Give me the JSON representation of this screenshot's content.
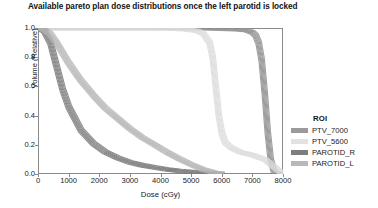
{
  "chart_data": {
    "type": "line",
    "title": "Available pareto plan dose distributions once the left parotid is locked",
    "xlabel": "Dose (cGy)",
    "ylabel": "Volume (Relative)",
    "xlim": [
      0,
      8000
    ],
    "ylim": [
      0.0,
      1.0
    ],
    "xticks": [
      0,
      1000,
      2000,
      3000,
      4000,
      5000,
      6000,
      7000,
      8000
    ],
    "xticklabels": [
      "0",
      "1000",
      "2000",
      "3000",
      "4000",
      "5000",
      "6000",
      "7000",
      "8000"
    ],
    "yticks": [
      0.0,
      0.2,
      0.4,
      0.6,
      0.8,
      1.0
    ],
    "yticklabels": [
      "0.0",
      "0.2",
      "0.4",
      "0.6",
      "0.8",
      "1.0"
    ],
    "grid": false,
    "legend_position": "right",
    "legend_title": "ROI",
    "series": [
      {
        "name": "PTV_7000",
        "color": "#8f8f8f",
        "band": true,
        "x": [
          0,
          500,
          1000,
          2000,
          3000,
          4000,
          5000,
          6000,
          6500,
          6800,
          7000,
          7100,
          7200,
          7300,
          7400,
          7500,
          7600,
          7700,
          7800,
          8000
        ],
        "values": [
          1.0,
          1.0,
          1.0,
          1.0,
          1.0,
          1.0,
          1.0,
          0.995,
          0.99,
          0.985,
          0.97,
          0.95,
          0.9,
          0.78,
          0.55,
          0.28,
          0.09,
          0.02,
          0.0,
          0.0
        ]
      },
      {
        "name": "PTV_5600",
        "color": "#dcdcdc",
        "band": true,
        "x": [
          0,
          500,
          1000,
          2000,
          3000,
          4000,
          4800,
          5200,
          5400,
          5600,
          5700,
          5800,
          5900,
          6000,
          6100,
          6300,
          6600,
          7000,
          7400,
          7700,
          8000
        ],
        "values": [
          1.0,
          1.0,
          1.0,
          1.0,
          1.0,
          1.0,
          0.99,
          0.98,
          0.96,
          0.9,
          0.8,
          0.6,
          0.4,
          0.28,
          0.22,
          0.18,
          0.15,
          0.13,
          0.1,
          0.05,
          0.0
        ]
      },
      {
        "name": "PAROTID_R",
        "color": "#7a7a7a",
        "band": true,
        "x": [
          0,
          200,
          400,
          600,
          800,
          1000,
          1400,
          1800,
          2200,
          2600,
          3000,
          3400,
          3800,
          4200,
          4600,
          5000,
          5400,
          5800,
          6000
        ],
        "values": [
          1.0,
          0.98,
          0.9,
          0.74,
          0.58,
          0.46,
          0.3,
          0.21,
          0.15,
          0.11,
          0.08,
          0.06,
          0.045,
          0.032,
          0.022,
          0.014,
          0.007,
          0.002,
          0.0
        ]
      },
      {
        "name": "PAROTID_L",
        "color": "#b4b4b4",
        "band": true,
        "x": [
          0,
          200,
          400,
          600,
          800,
          1000,
          1400,
          1800,
          2200,
          2600,
          3000,
          3400,
          3800,
          4200,
          4600,
          5000,
          5400,
          5800,
          6000
        ],
        "values": [
          1.0,
          0.99,
          0.96,
          0.9,
          0.83,
          0.76,
          0.64,
          0.54,
          0.45,
          0.38,
          0.31,
          0.25,
          0.2,
          0.15,
          0.105,
          0.065,
          0.03,
          0.008,
          0.0
        ]
      }
    ]
  },
  "legend": {
    "title": "ROI",
    "items": [
      {
        "label": "PTV_7000",
        "color": "#9a9a9a"
      },
      {
        "label": "PTV_5600",
        "color": "#e2e2e2"
      },
      {
        "label": "PAROTID_R",
        "color": "#7d7d7d"
      },
      {
        "label": "PAROTID_L",
        "color": "#b8b8b8"
      }
    ]
  }
}
